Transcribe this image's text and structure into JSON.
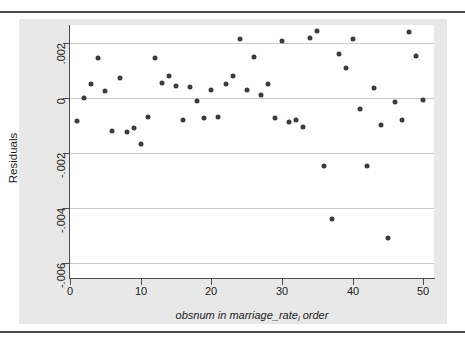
{
  "figure": {
    "colors": {
      "marker": "#3c3c3c",
      "grid": "#c9c9c9",
      "axis": "#4d4d4d",
      "graph_region_bg": "#e8e8e8",
      "plot_region_bg": "#ffffff",
      "rule": "#4a4a4a"
    },
    "y_axis_title": "Residuals",
    "x_axis_title_parts": {
      "main": "obsnum in marriage_rate",
      "subscript": "i",
      "tail": " order"
    },
    "x_axis_title_full": "obsnum in marriage_rate_i order"
  },
  "chart_data": {
    "type": "scatter",
    "title": "",
    "subtitle": "",
    "xlabel": "obsnum in marriage_rate_i order",
    "ylabel": "Residuals",
    "xlim": [
      0,
      51.5
    ],
    "ylim": [
      -0.00655,
      0.00265
    ],
    "xticks": [
      0,
      10,
      20,
      30,
      40,
      50
    ],
    "xticklabels": [
      "0",
      "10",
      "20",
      "30",
      "40",
      "50"
    ],
    "yticks": [
      0.002,
      0,
      -0.002,
      -0.004,
      -0.006
    ],
    "yticklabels": [
      ".002",
      "0",
      "-.002",
      "-.004",
      "-.006"
    ],
    "grid": "horizontal",
    "legend": "none",
    "marker": "filled-circle",
    "series": [
      {
        "name": "Residuals",
        "x": [
          1,
          2,
          3,
          4,
          5,
          6,
          7,
          8,
          9,
          10,
          11,
          12,
          13,
          14,
          15,
          16,
          17,
          18,
          19,
          20,
          21,
          22,
          23,
          24,
          25,
          26,
          27,
          28,
          29,
          30,
          31,
          32,
          33,
          34,
          35,
          36,
          37,
          38,
          39,
          40,
          41,
          42,
          43,
          44,
          45,
          46,
          47,
          48,
          49,
          50
        ],
        "y": [
          -0.00084,
          0.0,
          0.00049,
          0.00144,
          0.00026,
          -0.00121,
          0.00072,
          -0.00124,
          -0.00111,
          -0.00167,
          -0.00071,
          0.00145,
          0.00056,
          0.00078,
          0.00045,
          -0.00081,
          0.00038,
          -0.00012,
          -0.00072,
          0.0003,
          -0.00068,
          0.0005,
          0.00079,
          0.00213,
          0.0003,
          0.00148,
          0.00012,
          0.0005,
          -0.00073,
          0.00206,
          -0.00088,
          -0.00079,
          -0.00104,
          0.00219,
          0.00244,
          -0.00247,
          -0.00441,
          0.00159,
          0.00108,
          0.00214,
          -0.00041,
          -0.00248,
          0.00036,
          -0.00098,
          -0.00509,
          -0.00014,
          -0.00079,
          0.00238,
          0.00152,
          -6e-05
        ]
      }
    ]
  }
}
